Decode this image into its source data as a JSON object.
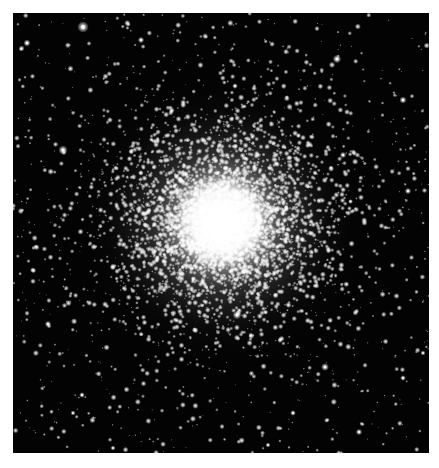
{
  "page": {
    "background": "#ffffff",
    "header_remnant": ""
  },
  "photo": {
    "subject": "globular star cluster",
    "frame": {
      "x": 13,
      "y": 13,
      "width": 416,
      "height": 440,
      "background": "#030303"
    },
    "cluster": {
      "center_x": 209,
      "center_y": 209,
      "core_radius": 48,
      "halo_radius": 150,
      "core_color": "#ffffff"
    },
    "starfield": {
      "seed": 20240611,
      "field_star_count": 900,
      "cluster_star_count": 5200,
      "star_color": "#ffffff"
    },
    "bright_stars": [
      {
        "x": 70,
        "y": 14,
        "r": 3.2
      },
      {
        "x": 128,
        "y": 27,
        "r": 1.8
      },
      {
        "x": 14,
        "y": 30,
        "r": 2.0
      },
      {
        "x": 50,
        "y": 137,
        "r": 2.6
      },
      {
        "x": 324,
        "y": 46,
        "r": 2.4
      },
      {
        "x": 390,
        "y": 87,
        "r": 2.0
      },
      {
        "x": 222,
        "y": 73,
        "r": 1.6
      },
      {
        "x": 35,
        "y": 311,
        "r": 1.8
      },
      {
        "x": 69,
        "y": 382,
        "r": 1.6
      },
      {
        "x": 312,
        "y": 354,
        "r": 2.2
      },
      {
        "x": 224,
        "y": 302,
        "r": 2.4
      },
      {
        "x": 346,
        "y": 419,
        "r": 1.8
      },
      {
        "x": 395,
        "y": 178,
        "r": 1.8
      },
      {
        "x": 390,
        "y": 365,
        "r": 1.6
      },
      {
        "x": 60,
        "y": 400,
        "r": 1.4
      },
      {
        "x": 280,
        "y": 400,
        "r": 1.6
      },
      {
        "x": 330,
        "y": 142,
        "r": 1.8
      },
      {
        "x": 410,
        "y": 340,
        "r": 1.4
      },
      {
        "x": 100,
        "y": 435,
        "r": 1.4
      },
      {
        "x": 255,
        "y": 432,
        "r": 1.4
      }
    ]
  }
}
